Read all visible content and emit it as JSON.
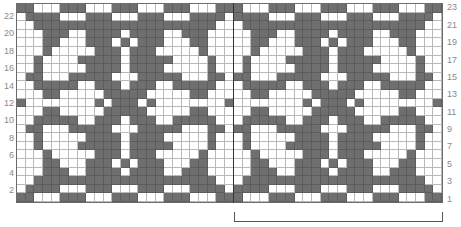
{
  "chart": {
    "columns": 49,
    "rows": 23,
    "repeat_width": 24,
    "colors": {
      "dark": "#6f6f6f",
      "light": "#ffffff",
      "grid": "#b9b9b9"
    },
    "legend_note": "D = dark (contrast color), L = light (background color); rows listed top (row 23) to bottom (row 1)",
    "row_labels_left": [
      "22",
      "20",
      "18",
      "16",
      "14",
      "12",
      "10",
      "8",
      "6",
      "4",
      "2"
    ],
    "row_labels_right": [
      "23",
      "21",
      "19",
      "17",
      "15",
      "13",
      "11",
      "9",
      "7",
      "5",
      "3",
      "1"
    ],
    "grid_rows": [
      {
        "row": 23,
        "cells": "DDLLLDDDLLLDDDLLLDDDLLLDDDLLLDDDLLLDDDLLLDDDLLLDD"
      },
      {
        "row": 22,
        "cells": "LDDDDLLLDDDLLLDDDLLLDDDDLDDDDLLLDDDLLLDDDLLLDDDDL"
      },
      {
        "row": 21,
        "cells": "LLDDDDDDDDDDDDDDDDDDDDDLLLDDDDDDDDDDDDDDDDDDDDDLL"
      },
      {
        "row": 20,
        "cells": "LLLDDDLLDDDDLDDDDLLDDDLLLLLDDDLLDDDDLDDDDLLDDDLLL"
      },
      {
        "row": 19,
        "cells": "LLLDDLLLDDDLDLDDDLLLDDLLLLLDDLLLDDDLDLDDDLLLDDLLL"
      },
      {
        "row": 18,
        "cells": "LLLDLLLLLDDDLDDDLLLLLDLLLLLDLLLLLDDDLDDDLLLLLDLLL"
      },
      {
        "row": 17,
        "cells": "LLDLLLLDDDDDLDDDDDLLLLDLLLDLLLLDDDDDLDDDDDLLLLDLL"
      },
      {
        "row": 16,
        "cells": "LLDLLLLLDDDDLDDDDLLLLLDLLLDLLLLLDDDDLDDDDLLLLLDLL"
      },
      {
        "row": 15,
        "cells": "LDDLLLDDDDDLLLDDDDDLLLDDLDDLLLDDDDDLLLDDDDDLLLDDL"
      },
      {
        "row": 14,
        "cells": "LLDDDDDLLDDDLDDDLLDDDDDLLLDDDDDLLDDDLDDDLLDDDDDLL"
      },
      {
        "row": 13,
        "cells": "LLLDDLLLLLDDDDDLLLLLDDLLLLLDDLLLLLDDDDDLLLLLDDLLL"
      },
      {
        "row": 12,
        "cells": "DLLLLLLLLDLDDDLDLLLLLLLLDLLLLLLLLDLDDDLDLLLLLLLLD"
      },
      {
        "row": 11,
        "cells": "LLLDDLLLLLDDDDDLLLLLDDLLLLLDDLLLLLDDDDDLLLLLDDLLL"
      },
      {
        "row": 10,
        "cells": "LLDDDDDLLDDDLDDDLLDDDDDLLLDDDDDLLDDDLDDDLLDDDDDLL"
      },
      {
        "row": 9,
        "cells": "LDDLLLDDDDDLLLDDDDDLLLDDLDDLLLDDDDDLLLDDDDDLLLDDL"
      },
      {
        "row": 8,
        "cells": "LLDLLLLLDDDDLDDDDLLLLLDLLLDLLLLLDDDDLDDDDLLLLLDLL"
      },
      {
        "row": 7,
        "cells": "LLDLLLLDDDDDLDDDDDLLLLDLLLDLLLLDDDDDLDDDDDLLLLDLL"
      },
      {
        "row": 6,
        "cells": "LLLDLLLLLDDDLDDDLLLLLDLLLLLDLLLLLDDDLDDDLLLLLDLLL"
      },
      {
        "row": 5,
        "cells": "LLLDDLLLDDDLDLDDDLLLDDLLLLLDDLLLDDDLDLDDDLLLDDLLL"
      },
      {
        "row": 4,
        "cells": "LLLDDDLLDDDDLDDDDLLDDDLLLLLDDDLLDDDDLDDDDLLDDDLLL"
      },
      {
        "row": 3,
        "cells": "LLDDDDDDDDDDDDDDDDDDDDDLLLDDDDDDDDDDDDDDDDDDDDDLL"
      },
      {
        "row": 2,
        "cells": "LDDDDLLLDDDLLLDDDLLLDDDDLDDDDLLLDDDLLLDDDLLLDDDDL"
      },
      {
        "row": 1,
        "cells": "DDLLLDDDLLLDDDLLLDDDLLLDDDLLLDDDLLLDDDLLLDDDLLLDD"
      }
    ],
    "repeat_bracket": {
      "from_column": 26,
      "to_column": 49,
      "label": ""
    }
  }
}
